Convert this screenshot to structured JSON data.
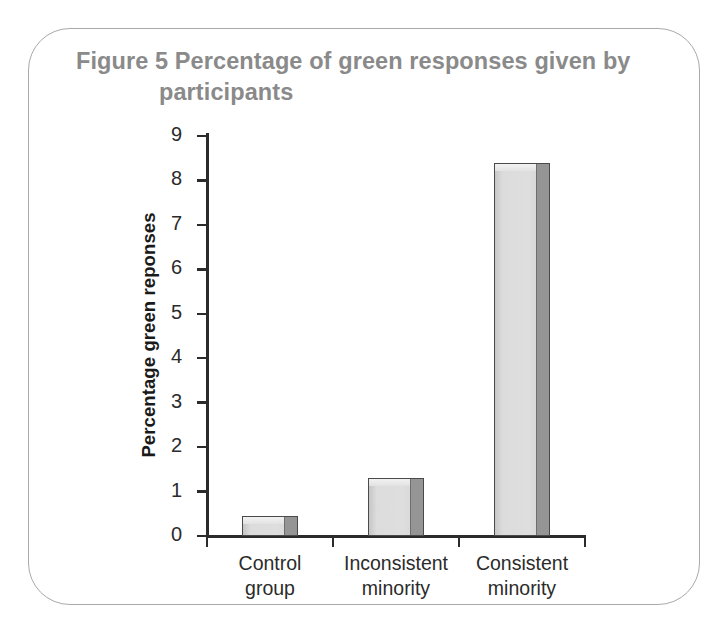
{
  "figure": {
    "label": "Figure 5",
    "title_line1": "Figure 5  Percentage of green responses given by",
    "title_line2": "participants"
  },
  "chart_data": {
    "type": "bar",
    "title": "Figure 5  Percentage of green responses given by participants",
    "xlabel": "",
    "ylabel": "Percentage green reponses",
    "categories": [
      "Control group",
      "Inconsistent minority",
      "Consistent minority"
    ],
    "category_lines": [
      [
        "Control",
        "group"
      ],
      [
        "Inconsistent",
        "minority"
      ],
      [
        "Consistent",
        "minority"
      ]
    ],
    "values": [
      0.45,
      1.3,
      8.4
    ],
    "ylim": [
      0,
      9
    ],
    "yticks": [
      0,
      1,
      2,
      3,
      4,
      5,
      6,
      7,
      8,
      9
    ],
    "ytick_labels": [
      "0",
      "1",
      "2",
      "3",
      "4",
      "5",
      "6",
      "7",
      "8",
      "9"
    ],
    "grid": false,
    "legend": false,
    "bar_color": "#dedede",
    "bar_side_color": "#959595",
    "bar_outline_color": "#4a4a4a",
    "axis_color": "#2b2b2b",
    "title_color": "#8a8a8a",
    "frame_color": "#a9a9a9"
  }
}
